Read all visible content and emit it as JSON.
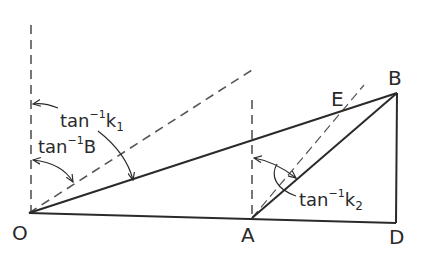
{
  "diagram": {
    "points": {
      "O": {
        "label": "O",
        "x": 29,
        "y": 213
      },
      "A": {
        "label": "A",
        "x": 252,
        "y": 218
      },
      "D": {
        "label": "D",
        "x": 396,
        "y": 223
      },
      "B": {
        "label": "B",
        "x": 397,
        "y": 93
      },
      "E": {
        "label": "E",
        "x": 342,
        "y": 111
      }
    },
    "angle_labels": {
      "k1": {
        "base": "tan",
        "sup": "−1",
        "var": "k",
        "sub": "1"
      },
      "B": {
        "base": "tan",
        "sup": "−1",
        "var": "B",
        "sub": ""
      },
      "k2": {
        "base": "tan",
        "sup": "−1",
        "var": "k",
        "sub": "2"
      }
    },
    "colors": {
      "line": "#2a2a2a",
      "dashed": "#555555",
      "background": "#ffffff"
    }
  }
}
